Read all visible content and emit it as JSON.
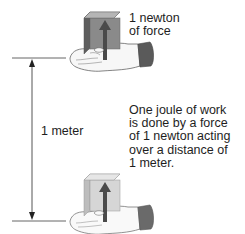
{
  "diagram": {
    "title": "One joule of work",
    "top_label": [
      "1 newton",
      "of force"
    ],
    "distance_label": "1 meter",
    "description": [
      "One joule of work",
      "is done by a force",
      "of 1 newton acting",
      "over a distance of",
      "1 meter."
    ],
    "elements": {
      "top_hand": "hand-holding-cube-icon",
      "bottom_hand": "hand-holding-cube-icon",
      "force_arrow": "up-arrow-icon",
      "dimension": "double-headed-arrow-icon"
    },
    "colors": {
      "cube_front": "#8a8a8a",
      "cube_side": "#5e5e5e",
      "cube_top": "#b5b5b5",
      "cube_front_light": "#d6d6d6",
      "cube_side_light": "#bdbdbd",
      "cube_top_light": "#e6e6e6",
      "arrow": "#4a4a4a",
      "cuff": "#5a5a5a",
      "line": "#555555"
    }
  }
}
